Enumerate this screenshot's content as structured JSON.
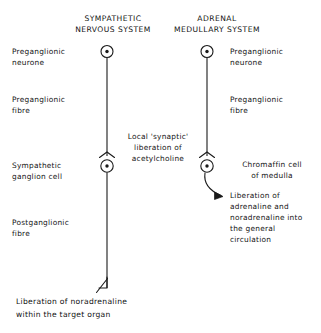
{
  "figure": {
    "columns": [
      {
        "id": "sympathetic",
        "title": "SYMPATHETIC\nNERVOUS SYSTEM"
      },
      {
        "id": "adrenal",
        "title": "ADRENAL\nMEDULLARY SYSTEM"
      }
    ],
    "left_labels": [
      {
        "id": "preganglionic-neurone",
        "text": "Preganglionic\nneurone"
      },
      {
        "id": "preganglionic-fibre",
        "text": "Preganglionic\nfibre"
      },
      {
        "id": "sympathetic-ganglion-cell",
        "text": "Sympathetic\nganglion cell"
      },
      {
        "id": "postganglionic-fibre",
        "text": "Postganglionic\nfibre"
      }
    ],
    "centre_labels": [
      {
        "id": "synaptic-liberation",
        "text": "Local 'synaptic'\nliberation of\nacetylcholine"
      }
    ],
    "right_labels": [
      {
        "id": "preganglionic-neurone-right",
        "text": "Preganglionic\nneurone"
      },
      {
        "id": "preganglionic-fibre-right",
        "text": "Preganglionic\nfibre"
      },
      {
        "id": "chromaffin-cell",
        "text": "Chromaffin cell\nof medulla"
      },
      {
        "id": "liberation-adrenaline",
        "text": "Liberation of\nadrenaline and\nnoradrenaline into\nthe general\ncirculation"
      }
    ],
    "bottom_note": {
      "id": "target-organ-liberation",
      "text": "Liberation of noradrenaline\nwithin the target organ"
    },
    "icons": {
      "cell_body": "neurone-cell-body-icon",
      "synapse": "synapse-arrowhead-icon",
      "terminal_arrow": "nerve-terminal-arrow-icon",
      "secretion_arrow": "hormone-secretion-curved-arrow-icon",
      "fibre_line": "nerve-fibre-line"
    },
    "colors": {
      "ink": "#141414",
      "background": "#ffffff",
      "line": "#1a1a1a"
    }
  }
}
